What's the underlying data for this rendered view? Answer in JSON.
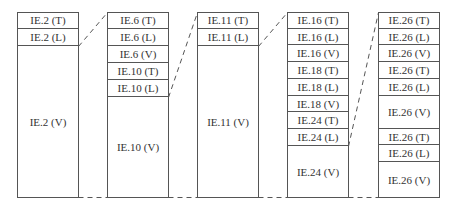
{
  "diagram": {
    "type": "stacked-block-expansion",
    "columns": [
      {
        "id": "col1",
        "x": 17,
        "width": 61,
        "top": 12,
        "bottom": 197,
        "cells": [
          {
            "label": "IE.2 (T)",
            "top": 12,
            "bottom": 29
          },
          {
            "label": "IE.2 (L)",
            "top": 29,
            "bottom": 46
          },
          {
            "label": "IE.2 (V)",
            "top": 46,
            "bottom": 197
          }
        ]
      },
      {
        "id": "col2",
        "x": 107,
        "width": 61,
        "top": 12,
        "bottom": 197,
        "cells": [
          {
            "label": "IE.6 (T)",
            "top": 12,
            "bottom": 29
          },
          {
            "label": "IE.6 (L)",
            "top": 29,
            "bottom": 46
          },
          {
            "label": "IE.6 (V)",
            "top": 46,
            "bottom": 63
          },
          {
            "label": "IE.10 (T)",
            "top": 63,
            "bottom": 80
          },
          {
            "label": "IE.10 (L)",
            "top": 80,
            "bottom": 97
          },
          {
            "label": "IE.10 (V)",
            "top": 97,
            "bottom": 197
          }
        ]
      },
      {
        "id": "col3",
        "x": 197,
        "width": 61,
        "top": 12,
        "bottom": 197,
        "cells": [
          {
            "label": "IE.11 (T)",
            "top": 12,
            "bottom": 29
          },
          {
            "label": "IE.11 (L)",
            "top": 29,
            "bottom": 46
          },
          {
            "label": "IE.11 (V)",
            "top": 46,
            "bottom": 197
          }
        ]
      },
      {
        "id": "col4",
        "x": 287,
        "width": 61,
        "top": 12,
        "bottom": 197,
        "cells": [
          {
            "label": "IE.16 (T)",
            "top": 12,
            "bottom": 29
          },
          {
            "label": "IE.16 (L)",
            "top": 29,
            "bottom": 45
          },
          {
            "label": "IE.16 (V)",
            "top": 45,
            "bottom": 62
          },
          {
            "label": "IE.18 (T)",
            "top": 62,
            "bottom": 79
          },
          {
            "label": "IE.18 (L)",
            "top": 79,
            "bottom": 96
          },
          {
            "label": "IE.18 (V)",
            "top": 96,
            "bottom": 112
          },
          {
            "label": "IE.24 (T)",
            "top": 112,
            "bottom": 129
          },
          {
            "label": "IE.24 (L)",
            "top": 129,
            "bottom": 146
          },
          {
            "label": "IE.24 (V)",
            "top": 146,
            "bottom": 197
          }
        ]
      },
      {
        "id": "col5",
        "x": 378,
        "width": 61,
        "top": 12,
        "bottom": 197,
        "cells": [
          {
            "label": "IE.26 (T)",
            "top": 12,
            "bottom": 29
          },
          {
            "label": "IE.26 (L)",
            "top": 29,
            "bottom": 45
          },
          {
            "label": "IE.26 (V)",
            "top": 45,
            "bottom": 62
          },
          {
            "label": "IE.26 (T)",
            "top": 62,
            "bottom": 79
          },
          {
            "label": "IE.26 (L)",
            "top": 79,
            "bottom": 96
          },
          {
            "label": "IE.26 (V)",
            "top": 96,
            "bottom": 129
          },
          {
            "label": "IE.26 (T)",
            "top": 129,
            "bottom": 145
          },
          {
            "label": "IE.26 (L)",
            "top": 145,
            "bottom": 162
          },
          {
            "label": "IE.26 (V)",
            "top": 162,
            "bottom": 197
          }
        ]
      }
    ],
    "connectors": [
      {
        "from": [
          78,
          46
        ],
        "to": [
          107,
          12
        ],
        "style": "dashed"
      },
      {
        "from": [
          168,
          97
        ],
        "to": [
          197,
          12
        ],
        "style": "dashed"
      },
      {
        "from": [
          258,
          46
        ],
        "to": [
          287,
          12
        ],
        "style": "dashed"
      },
      {
        "from": [
          348,
          146
        ],
        "to": [
          378,
          12
        ],
        "style": "dashed"
      },
      {
        "from": [
          78,
          197
        ],
        "to": [
          107,
          197
        ],
        "style": "dashed"
      },
      {
        "from": [
          168,
          197
        ],
        "to": [
          197,
          197
        ],
        "style": "dashed"
      },
      {
        "from": [
          258,
          197
        ],
        "to": [
          287,
          197
        ],
        "style": "dashed"
      },
      {
        "from": [
          348,
          197
        ],
        "to": [
          378,
          197
        ],
        "style": "dashed"
      }
    ],
    "colors": {
      "line": "#555555",
      "text": "#333333",
      "background": "#ffffff"
    }
  }
}
